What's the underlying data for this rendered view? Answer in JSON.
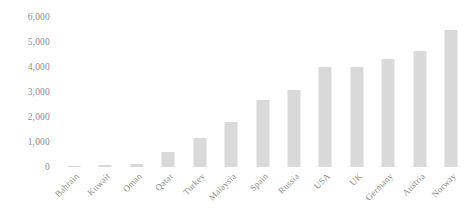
{
  "chart_data": {
    "type": "bar",
    "title": "",
    "subtitle": "",
    "xlabel": "",
    "ylabel": "",
    "grid": false,
    "legend": false,
    "ylim": [
      0,
      6000
    ],
    "yticks": [
      "0",
      "1,000",
      "2,000",
      "3,000",
      "4,000",
      "5,000",
      "6,000"
    ],
    "ytick_values": [
      0,
      1000,
      2000,
      3000,
      4000,
      5000,
      6000
    ],
    "bar_color": "#d9d9d9",
    "background_color": "#ffffff",
    "axis_text_color": "#8c8c8c",
    "categories": [
      "Bahrain",
      "Kuwait",
      "Oman",
      "Qatar",
      "Turkey",
      "Malaysia",
      "Spain",
      "Russia",
      "USA",
      "UK",
      "Germany",
      "Austria",
      "Norway"
    ],
    "values": [
      60,
      100,
      130,
      600,
      1150,
      1800,
      2700,
      3080,
      4000,
      4000,
      4320,
      4640,
      5500
    ],
    "series": [
      {
        "name": "",
        "values": [
          60,
          100,
          130,
          600,
          1150,
          1800,
          2700,
          3080,
          4000,
          4000,
          4320,
          4640,
          5500
        ]
      }
    ]
  }
}
